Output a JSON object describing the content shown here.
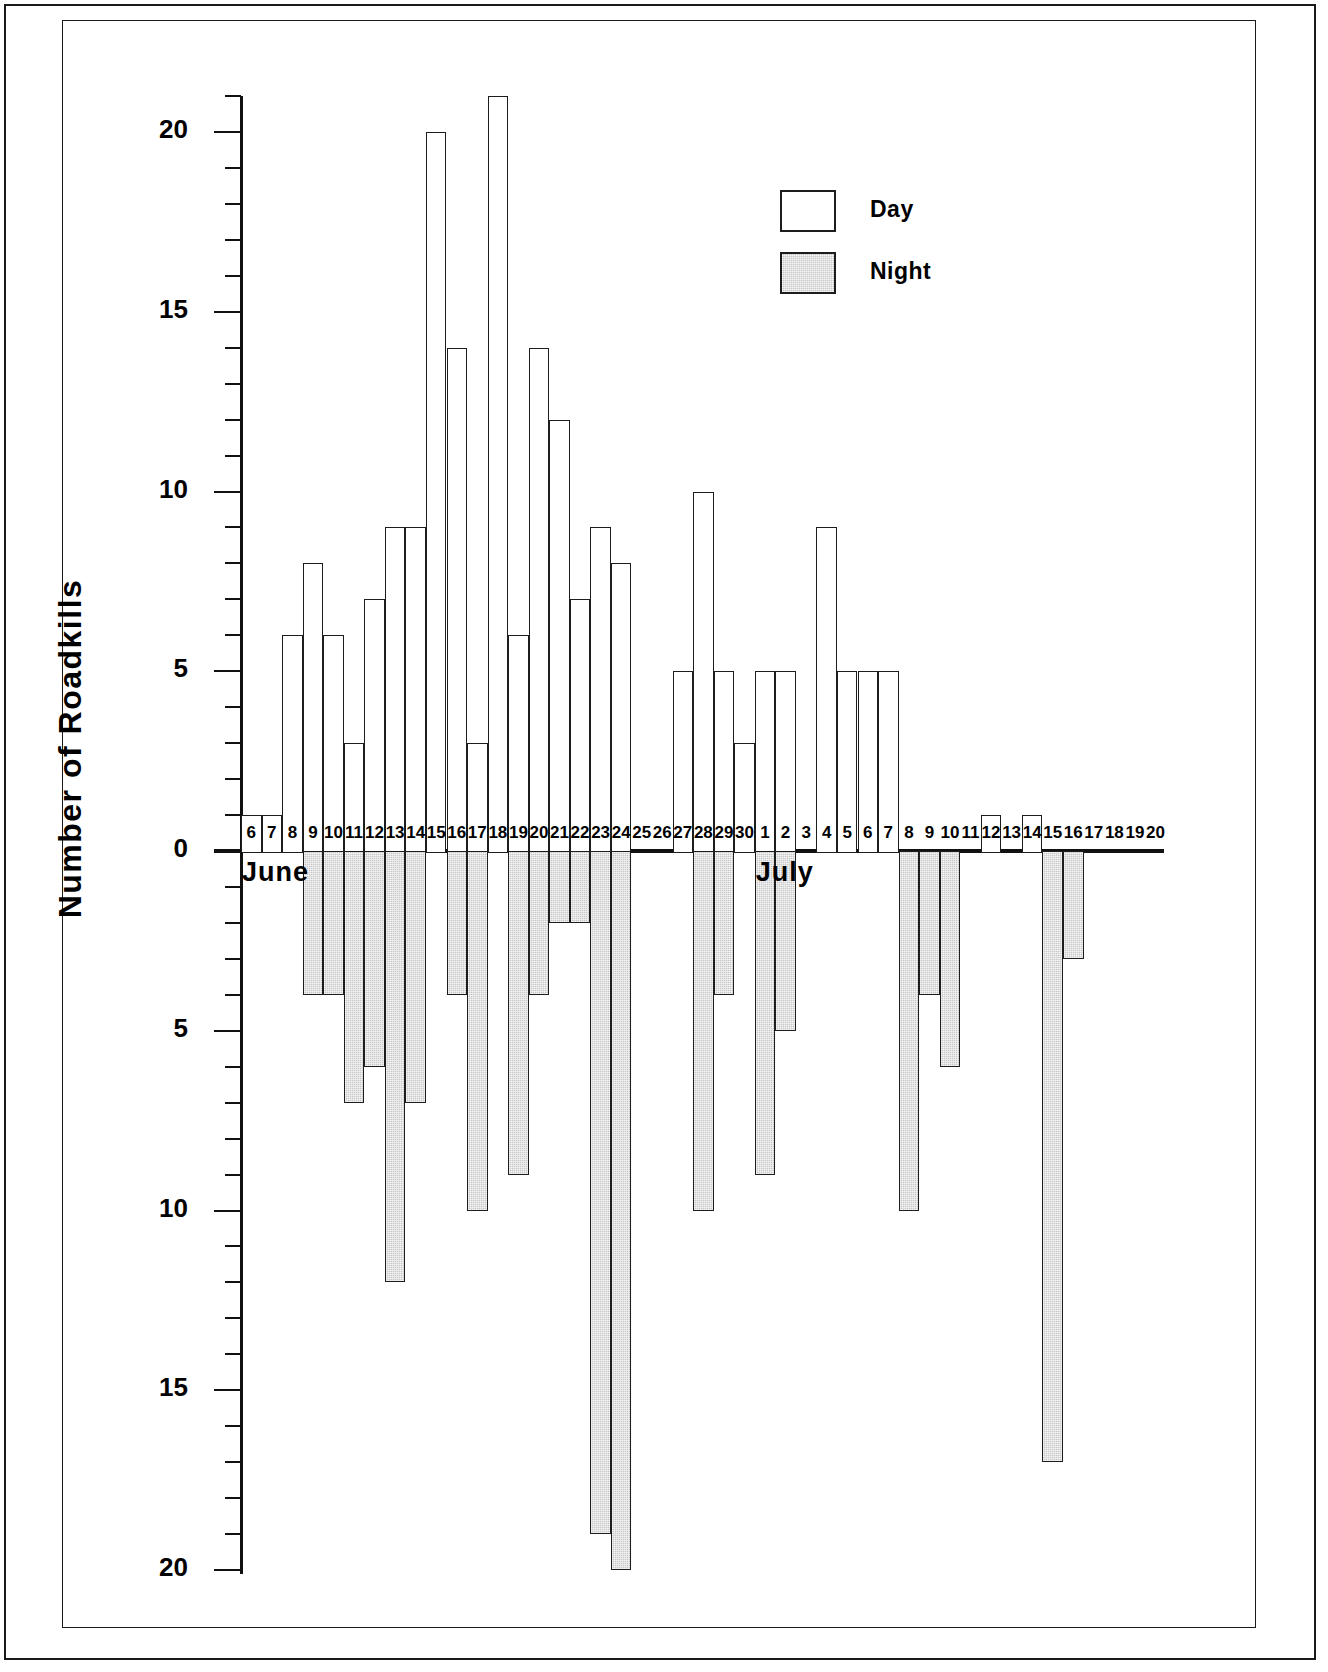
{
  "chart_data": {
    "type": "bar",
    "title": "",
    "xlabel": "",
    "ylabel": "Number of Roadkills",
    "orientation": "vertical",
    "grid": false,
    "legend_position": "upper-right",
    "note": "Back-to-back (diverging) bar chart: Day counts plotted upward as positive, Night counts plotted downward below the zero line. Both axis directions are labelled with positive magnitudes (0,5,10,15,20).",
    "yaxis": {
      "up_tick_labels": [
        "0",
        "5",
        "10",
        "15",
        "20"
      ],
      "down_tick_labels": [
        "0",
        "5",
        "10",
        "15",
        "20"
      ],
      "major_interval": 5,
      "minor_interval": 1,
      "up_limit": 21,
      "down_limit": 20
    },
    "categories": [
      "6",
      "7",
      "8",
      "9",
      "10",
      "11",
      "12",
      "13",
      "14",
      "15",
      "16",
      "17",
      "18",
      "19",
      "20",
      "21",
      "22",
      "23",
      "24",
      "25",
      "26",
      "27",
      "28",
      "29",
      "30",
      "1",
      "2",
      "3",
      "4",
      "5",
      "6",
      "7",
      "8",
      "9",
      "10",
      "11",
      "12",
      "13",
      "14",
      "15",
      "16",
      "17",
      "18",
      "19",
      "20"
    ],
    "category_months": [
      "June",
      "June",
      "June",
      "June",
      "June",
      "June",
      "June",
      "June",
      "June",
      "June",
      "June",
      "June",
      "June",
      "June",
      "June",
      "June",
      "June",
      "June",
      "June",
      "June",
      "June",
      "June",
      "June",
      "June",
      "June",
      "July",
      "July",
      "July",
      "July",
      "July",
      "July",
      "July",
      "July",
      "July",
      "July",
      "July",
      "July",
      "July",
      "July",
      "July",
      "July",
      "July",
      "July",
      "July",
      "July"
    ],
    "month_markers": [
      {
        "label": "June",
        "at_category": "6"
      },
      {
        "label": "July",
        "at_category": "1"
      }
    ],
    "series": [
      {
        "name": "Day",
        "fill": "#ffffff",
        "direction": "up",
        "values": [
          1,
          1,
          6,
          8,
          6,
          3,
          7,
          9,
          9,
          20,
          14,
          3,
          21,
          6,
          14,
          12,
          7,
          9,
          8,
          0,
          0,
          5,
          10,
          5,
          3,
          5,
          5,
          0,
          9,
          5,
          5,
          5,
          0,
          0,
          0,
          0,
          1,
          0,
          1,
          0,
          0,
          0,
          0,
          0,
          0
        ]
      },
      {
        "name": "Night",
        "fill": "#c8c8c8",
        "direction": "down",
        "values": [
          0,
          0,
          0,
          4,
          4,
          7,
          6,
          12,
          7,
          0,
          4,
          10,
          0,
          9,
          4,
          2,
          2,
          19,
          20,
          0,
          0,
          0,
          10,
          4,
          0,
          9,
          5,
          0,
          0,
          0,
          0,
          0,
          10,
          4,
          6,
          0,
          0,
          0,
          0,
          17,
          3,
          0,
          0,
          0,
          0
        ]
      }
    ]
  },
  "legend": {
    "items": [
      {
        "label": "Day",
        "swatch": "day-swatch"
      },
      {
        "label": "Night",
        "swatch": "night-swatch"
      }
    ]
  },
  "axis_labels": {
    "y_title": "Number of Roadkills"
  }
}
